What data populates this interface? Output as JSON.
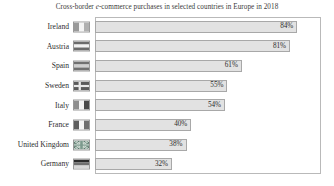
{
  "chart_data": {
    "type": "bar",
    "orientation": "horizontal",
    "title_prefix": "Cross-border ",
    "title_italic": "e",
    "title_suffix": "-commerce purchases in selected countries in Europe in 2018",
    "title": "Cross-border e-commerce purchases in selected countries in Europe in 2018",
    "xlabel": "",
    "ylabel": "",
    "xlim": [
      0,
      93
    ],
    "grid": false,
    "legend": null,
    "value_suffix": "%",
    "bar_color": "#e2e2e2",
    "bar_border_color": "#a8a8a8",
    "plot_border_color": "#b9b9b9",
    "background": "#ffffff",
    "categories": [
      "Ireland",
      "Austria",
      "Spain",
      "Sweden",
      "Italy",
      "France",
      "United Kingdom",
      "Germany"
    ],
    "values": [
      84,
      81,
      61,
      55,
      54,
      40,
      38,
      32
    ],
    "labels": [
      "84%",
      "81%",
      "61%",
      "55%",
      "54%",
      "40%",
      "38%",
      "32%"
    ]
  },
  "rows": [
    {
      "country": "Ireland",
      "value": 84,
      "label": "84%",
      "flag": {
        "name": "flag-ireland",
        "type": "vertical",
        "colors": [
          "#9a9a9a",
          "#f4f4f4",
          "#b0b0b0"
        ]
      }
    },
    {
      "country": "Austria",
      "value": 81,
      "label": "81%",
      "flag": {
        "name": "flag-austria",
        "type": "horizontal",
        "colors": [
          "#6b6b6b",
          "#f2f2f2",
          "#6b6b6b"
        ]
      }
    },
    {
      "country": "Spain",
      "value": 61,
      "label": "61%",
      "flag": {
        "name": "flag-spain",
        "type": "horizontal",
        "colors": [
          "#707070",
          "#cfcfcf",
          "#707070"
        ]
      }
    },
    {
      "country": "Sweden",
      "value": 55,
      "label": "55%",
      "flag": {
        "name": "flag-sweden",
        "type": "nordic-cross",
        "colors": [
          "#5a5a5a",
          "#e8e8e8"
        ]
      }
    },
    {
      "country": "Italy",
      "value": 54,
      "label": "54%",
      "flag": {
        "name": "flag-italy",
        "type": "vertical",
        "colors": [
          "#8e8e8e",
          "#f4f4f4",
          "#4a4a4a"
        ]
      }
    },
    {
      "country": "France",
      "value": 40,
      "label": "40%",
      "flag": {
        "name": "flag-france",
        "type": "vertical",
        "colors": [
          "#5d5d5d",
          "#f4f4f4",
          "#6e6e6e"
        ]
      }
    },
    {
      "country": "United Kingdom",
      "value": 38,
      "label": "38%",
      "flag": {
        "name": "flag-united-kingdom",
        "type": "union-jack",
        "colors": [
          "#4f6f63",
          "#e9efe9",
          "#7d9a8e"
        ]
      }
    },
    {
      "country": "Germany",
      "value": 32,
      "label": "32%",
      "flag": {
        "name": "flag-germany",
        "type": "horizontal",
        "colors": [
          "#2b2b2b",
          "#6f6f6f",
          "#d8d8d8"
        ]
      }
    }
  ]
}
